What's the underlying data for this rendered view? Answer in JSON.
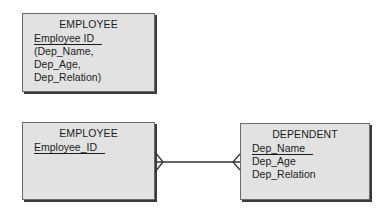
{
  "diagram": {
    "type": "entity-relationship",
    "top_entity": {
      "title": "EMPLOYEE",
      "primary_key": "Employee ID",
      "attributes": [
        "(Dep_Name,",
        "Dep_Age,",
        "Dep_Relation)"
      ]
    },
    "employee_entity": {
      "title": "EMPLOYEE",
      "primary_key": "Employee_ID",
      "attributes": []
    },
    "dependent_entity": {
      "title": "DEPENDENT",
      "primary_key": "Dep_Name",
      "attributes": [
        "Dep_Age",
        "Dep_Relation"
      ]
    },
    "relationship": {
      "from": "EMPLOYEE",
      "to": "DEPENDENT",
      "from_end": "crow's foot (many)",
      "to_end": "crow's foot (many)"
    },
    "colors": {
      "entity_fill": "#e2e2e2",
      "entity_border": "#6b6b6b",
      "shadow": "#3a3a3a",
      "line": "#333333"
    }
  }
}
